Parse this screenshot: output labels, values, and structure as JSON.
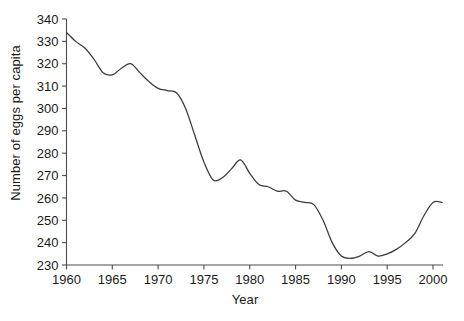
{
  "chart_data": {
    "type": "line",
    "title": "",
    "subtitle": "",
    "xlabel": "Year",
    "ylabel": "Number of eggs per capita",
    "xlim": [
      1960,
      2001
    ],
    "ylim": [
      230,
      340
    ],
    "grid": false,
    "legend": null,
    "xticks": [
      1960,
      1965,
      1970,
      1975,
      1980,
      1985,
      1990,
      1995,
      2000
    ],
    "xtick_labels": [
      "1960",
      "1965",
      "1970",
      "1975",
      "1980",
      "1985",
      "1990",
      "1995",
      "2000"
    ],
    "yticks": [
      230,
      240,
      250,
      260,
      270,
      280,
      290,
      300,
      310,
      320,
      330,
      340
    ],
    "ytick_labels": [
      "230",
      "240",
      "250",
      "260",
      "270",
      "280",
      "290",
      "300",
      "310",
      "320",
      "330",
      "340"
    ],
    "series": [
      {
        "name": "Number of eggs per capita",
        "color": "#3a3a3a",
        "x": [
          1960,
          1961,
          1962,
          1963,
          1964,
          1965,
          1966,
          1967,
          1968,
          1969,
          1970,
          1971,
          1972,
          1973,
          1974,
          1975,
          1976,
          1977,
          1978,
          1979,
          1980,
          1981,
          1982,
          1983,
          1984,
          1985,
          1986,
          1987,
          1988,
          1989,
          1990,
          1991,
          1992,
          1993,
          1994,
          1995,
          1996,
          1997,
          1998,
          1999,
          2000,
          2001
        ],
        "values": [
          334,
          330,
          327,
          322,
          316,
          315,
          318,
          320,
          316,
          312,
          309,
          308,
          307,
          300,
          288,
          276,
          268,
          269,
          273,
          277,
          271,
          266,
          265,
          263,
          263,
          259,
          258,
          257,
          250,
          240,
          234,
          233,
          234,
          236,
          234,
          235,
          237,
          240,
          244,
          252,
          258,
          258
        ]
      }
    ]
  },
  "axes": {
    "x_axis_title": "Year",
    "y_axis_title": "Number of eggs per capita"
  },
  "colors": {
    "line": "#3a3a3a",
    "axis": "#4d4d4d",
    "text": "#1a1a1a",
    "background": "#ffffff"
  }
}
